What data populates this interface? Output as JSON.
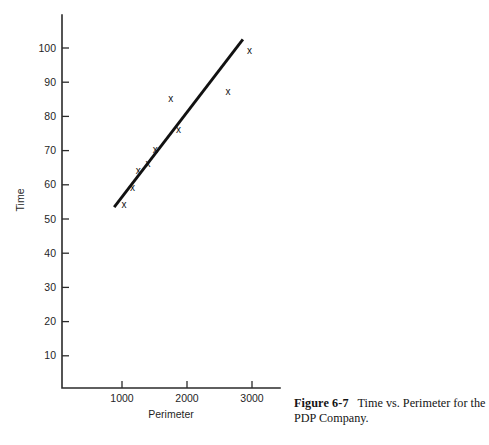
{
  "figure": {
    "caption_label": "Figure 6-7",
    "caption_text": "Time vs. Perimeter for the PDP Company."
  },
  "chart_data": {
    "type": "scatter",
    "title": "",
    "xlabel": "Perimeter",
    "ylabel": "Time",
    "xlim": [
      0,
      3400
    ],
    "ylim": [
      0,
      107
    ],
    "grid": false,
    "legend": null,
    "marker_glyph": "x",
    "x_ticks": [
      1000,
      2000,
      3000
    ],
    "x_tick_labels": [
      "1000",
      "2000",
      "3000"
    ],
    "y_ticks": [
      10,
      20,
      30,
      40,
      50,
      60,
      70,
      80,
      90,
      100
    ],
    "y_tick_labels": [
      "10",
      "20",
      "30",
      "40",
      "50",
      "60",
      "70",
      "80",
      "90",
      "100"
    ],
    "series": [
      {
        "name": "observations",
        "points": [
          {
            "x": 1030,
            "y": 54
          },
          {
            "x": 1160,
            "y": 59
          },
          {
            "x": 1250,
            "y": 64
          },
          {
            "x": 1400,
            "y": 66
          },
          {
            "x": 1510,
            "y": 70
          },
          {
            "x": 1750,
            "y": 85
          },
          {
            "x": 1870,
            "y": 76
          },
          {
            "x": 2630,
            "y": 87
          },
          {
            "x": 2960,
            "y": 99
          }
        ]
      }
    ],
    "fit_line": {
      "name": "regression-line",
      "x_start": 880,
      "y_start": 53.5,
      "x_end": 2860,
      "y_end": 102.5
    }
  },
  "colors": {
    "axis": "#2b2b2b",
    "line": "#111111",
    "marker": "#121212",
    "text": "#1f1f1f",
    "background": "#ffffff"
  }
}
